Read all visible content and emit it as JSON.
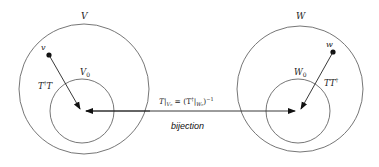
{
  "left": {
    "outer_label": "V",
    "inner_label": "V",
    "inner_sub": "0",
    "point_label": "v",
    "map_label_main": "T",
    "map_label_sup": "†",
    "map_label_tail": "T"
  },
  "right": {
    "outer_label": "W",
    "inner_label": "W",
    "inner_sub": "0",
    "point_label": "w",
    "map_label_main": "TT",
    "map_label_sup": "†"
  },
  "middle": {
    "formula": "T|V₀ = (T†|W₀)⁻¹",
    "formula_parts": {
      "t": "T|",
      "v0": "V₀",
      "eq": " = (T",
      "dag": "†",
      "bar": "|",
      "w0": "W₀",
      "close": ")",
      "inv": "−1"
    },
    "caption": "bijection"
  },
  "colors": {
    "circle": "#555555",
    "arrow": "#222222"
  }
}
